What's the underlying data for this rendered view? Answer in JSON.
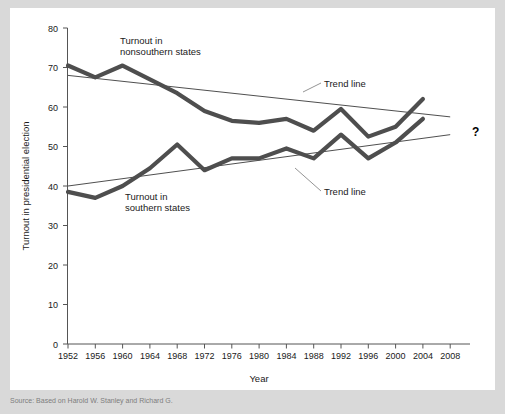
{
  "chart_data": {
    "type": "line",
    "title": "",
    "xlabel": "Year",
    "ylabel": "Turnout in presidential election",
    "x": [
      1952,
      1956,
      1960,
      1964,
      1968,
      1972,
      1976,
      1980,
      1984,
      1988,
      1992,
      1996,
      2000,
      2004
    ],
    "xticks": [
      "1952",
      "1956",
      "1960",
      "1964",
      "1968",
      "1972",
      "1976",
      "1980",
      "1984",
      "1988",
      "1992",
      "1996",
      "2000",
      "2004",
      "2008"
    ],
    "yticks": [
      "0",
      "10",
      "20",
      "30",
      "40",
      "50",
      "60",
      "70",
      "80"
    ],
    "xlim": [
      1952,
      2008
    ],
    "ylim": [
      0,
      80
    ],
    "grid": false,
    "legend_position": "inline-annotations",
    "series": [
      {
        "name": "Turnout in nonsouthern states",
        "color": "#4e4e4e",
        "values": [
          70.5,
          67.5,
          70.5,
          67.0,
          63.5,
          59.0,
          56.5,
          56.0,
          57.0,
          54.0,
          59.5,
          52.5,
          55.0,
          62.0
        ]
      },
      {
        "name": "Turnout in southern states",
        "color": "#4e4e4e",
        "values": [
          38.5,
          37.0,
          40.0,
          44.5,
          50.5,
          44.0,
          47.0,
          47.0,
          49.5,
          47.0,
          53.0,
          47.0,
          51.0,
          57.0
        ]
      }
    ],
    "trend_lines": [
      {
        "name": "Trend line (nonsouthern)",
        "color": "#222222",
        "x": [
          1952,
          2008
        ],
        "values": [
          68.0,
          57.5
        ]
      },
      {
        "name": "Trend line (southern)",
        "color": "#222222",
        "x": [
          1952,
          2008
        ],
        "values": [
          40.0,
          53.0
        ]
      }
    ],
    "annotations": [
      {
        "id": "nonsouthern-label",
        "text_line1": "Turnout in",
        "text_line2": "nonsouthern states"
      },
      {
        "id": "southern-label",
        "text_line1": "Turnout in",
        "text_line2": "southern states"
      },
      {
        "id": "trend-upper-label",
        "text": "Trend line"
      },
      {
        "id": "trend-lower-label",
        "text": "Trend line"
      },
      {
        "id": "future-question",
        "text": "?"
      }
    ]
  },
  "axes": {
    "y_title": "Turnout in presidential election",
    "x_title": "Year",
    "y_tick_labels": [
      "80",
      "70",
      "60",
      "50",
      "40",
      "30",
      "20",
      "10",
      "0"
    ],
    "x_tick_labels": [
      "1952",
      "1956",
      "1960",
      "1964",
      "1968",
      "1972",
      "1976",
      "1980",
      "1984",
      "1988",
      "1992",
      "1996",
      "2000",
      "2004",
      "2008"
    ]
  },
  "annotations": {
    "nonsouthern_line1": "Turnout in",
    "nonsouthern_line2": "nonsouthern states",
    "southern_line1": "Turnout in",
    "southern_line2": "southern states",
    "trend_upper": "Trend line",
    "trend_lower": "Trend line",
    "question_mark": "?"
  },
  "footer": {
    "source_note": "Source: Based on Harold W. Stanley and Richard G."
  }
}
